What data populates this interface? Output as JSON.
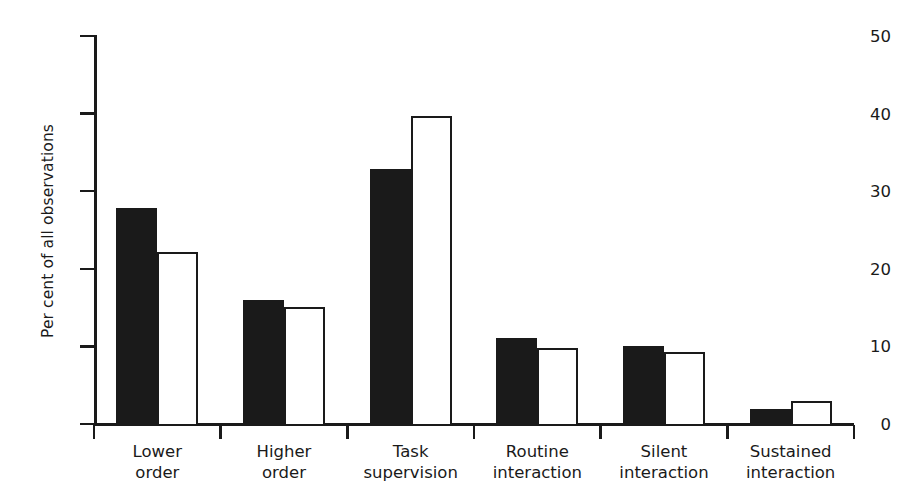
{
  "chart_data": {
    "type": "bar",
    "title": "",
    "subtitle": "",
    "xlabel": "",
    "ylabel": "Per cent of all observations",
    "ylim": [
      0,
      50
    ],
    "yticks": [
      0,
      10,
      20,
      30,
      40,
      50
    ],
    "ytick_labels": [
      "0",
      "10",
      "20",
      "30",
      "40",
      "50"
    ],
    "grid": false,
    "legend": "none",
    "categories": [
      "Lower order",
      "Higher order",
      "Task supervision",
      "Routine interaction",
      "Silent interaction",
      "Sustained interaction"
    ],
    "category_lines": [
      [
        "Lower",
        "order"
      ],
      [
        "Higher",
        "order"
      ],
      [
        "Task",
        "supervision"
      ],
      [
        "Routine",
        "interaction"
      ],
      [
        "Silent",
        "interaction"
      ],
      [
        "Sustained",
        "interaction"
      ]
    ],
    "series": [
      {
        "name": "filled",
        "style": "solid-black",
        "color": "#1a1a1a",
        "values": [
          27.8,
          16.0,
          32.8,
          11.1,
          10.1,
          1.9
        ]
      },
      {
        "name": "outlined",
        "style": "white-outline",
        "color": "#ffffff",
        "edge_color": "#1a1a1a",
        "values": [
          22.2,
          15.1,
          39.7,
          9.8,
          9.3,
          3.0
        ]
      }
    ]
  },
  "axis": {
    "y_title": "Per cent of all observations"
  },
  "colors": {
    "ink": "#1a1a1a",
    "paper": "#ffffff"
  }
}
